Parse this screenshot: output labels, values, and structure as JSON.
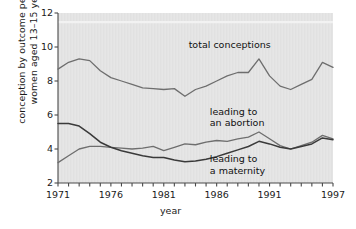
{
  "chart_data": {
    "type": "line",
    "title": "",
    "xlabel": "year",
    "ylabel": "conception by outcome per 1 000\nwomen aged 13–15 years",
    "xlim": [
      1971,
      1997
    ],
    "ylim": [
      2,
      12
    ],
    "xticks": [
      1971,
      1972,
      1973,
      1974,
      1975,
      1976,
      1977,
      1978,
      1979,
      1980,
      1981,
      1982,
      1983,
      1984,
      1985,
      1986,
      1987,
      1988,
      1989,
      1990,
      1991,
      1992,
      1993,
      1994,
      1995,
      1996,
      1997
    ],
    "xtick_labels": [
      "1971",
      "1976",
      "1981",
      "1986",
      "1991",
      "1997"
    ],
    "xtick_label_values": [
      1971,
      1976,
      1981,
      1986,
      1991,
      1997
    ],
    "yticks": [
      2,
      4,
      6,
      8,
      10,
      12
    ],
    "ytick_labels": [
      "2",
      "4",
      "6",
      "8",
      "10",
      "12"
    ],
    "grid": false,
    "legend_position": "inline-annotations",
    "x": [
      1971,
      1972,
      1973,
      1974,
      1975,
      1976,
      1977,
      1978,
      1979,
      1980,
      1981,
      1982,
      1983,
      1984,
      1985,
      1986,
      1987,
      1988,
      1989,
      1990,
      1991,
      1992,
      1993,
      1994,
      1995,
      1996,
      1997
    ],
    "series": [
      {
        "name": "total conceptions",
        "color": "#6e6e6e",
        "values": [
          8.7,
          9.1,
          9.3,
          9.2,
          8.6,
          8.2,
          8.0,
          7.8,
          7.6,
          7.55,
          7.5,
          7.55,
          7.1,
          7.5,
          7.7,
          8.0,
          8.3,
          8.5,
          8.5,
          9.3,
          8.3,
          7.7,
          7.5,
          7.8,
          8.1,
          9.1,
          8.8
        ]
      },
      {
        "name": "leading to an abortion",
        "color": "#6e6e6e",
        "values": [
          3.2,
          3.6,
          4.0,
          4.15,
          4.15,
          4.1,
          4.05,
          4.0,
          4.05,
          4.15,
          3.9,
          4.1,
          4.3,
          4.25,
          4.4,
          4.5,
          4.45,
          4.6,
          4.7,
          5.0,
          4.6,
          4.2,
          4.0,
          4.2,
          4.4,
          4.8,
          4.6
        ]
      },
      {
        "name": "leading to a maternity",
        "color": "#3a3a3a",
        "values": [
          5.5,
          5.5,
          5.35,
          4.9,
          4.4,
          4.1,
          3.9,
          3.75,
          3.6,
          3.5,
          3.5,
          3.35,
          3.25,
          3.3,
          3.4,
          3.55,
          3.75,
          3.95,
          4.15,
          4.45,
          4.3,
          4.1,
          4.0,
          4.15,
          4.3,
          4.65,
          4.55
        ]
      }
    ],
    "annotations": [
      {
        "text": "total conceptions",
        "x": 1986,
        "y": 10.1,
        "name": "annotation-total-conceptions"
      },
      {
        "text": "leading to\nan abortion",
        "x": 1988,
        "y": 6.2,
        "name": "annotation-leading-to-an-abortion"
      },
      {
        "text": "leading to\na maternity",
        "x": 1988,
        "y": 3.4,
        "name": "annotation-leading-to-a-maternity"
      }
    ],
    "colors": {
      "plot_background": "#e6e6e6",
      "axis": "#4a4a4a",
      "text": "#1a1a1a",
      "series_light": "#6e6e6e",
      "series_dark": "#3a3a3a"
    }
  }
}
